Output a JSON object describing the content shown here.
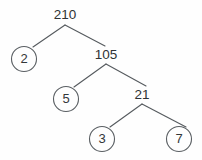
{
  "figure": {
    "type": "factor-tree",
    "background_color": "#fefefe",
    "line_color": "#555a5e",
    "text_color": "#333739"
  },
  "nodes": [
    {
      "id": "n210",
      "label": "210",
      "style": "plain",
      "x": 65,
      "y": 15,
      "radius": 0
    },
    {
      "id": "n2",
      "label": "2",
      "style": "circled",
      "x": 24,
      "y": 59,
      "radius": 12.5
    },
    {
      "id": "n105",
      "label": "105",
      "style": "plain",
      "x": 106,
      "y": 55,
      "radius": 0
    },
    {
      "id": "n5",
      "label": "5",
      "style": "circled",
      "x": 66,
      "y": 99,
      "radius": 12.5
    },
    {
      "id": "n21",
      "label": "21",
      "style": "plain",
      "x": 142,
      "y": 95,
      "radius": 0
    },
    {
      "id": "n3",
      "label": "3",
      "style": "circled",
      "x": 102,
      "y": 139,
      "radius": 12.5
    },
    {
      "id": "n7",
      "label": "7",
      "style": "circled",
      "x": 179,
      "y": 139,
      "radius": 12.5
    }
  ],
  "edges": [
    {
      "id": "e210-2",
      "from": "n210",
      "to": "n2",
      "path": "M 65 25 L 33 47"
    },
    {
      "id": "e210-105",
      "from": "n210",
      "to": "n105",
      "path": "M 65 25 L 105 46"
    },
    {
      "id": "e105-5",
      "from": "n105",
      "to": "n5",
      "path": "M 106 64 L 74 87"
    },
    {
      "id": "e105-21",
      "from": "n105",
      "to": "n21",
      "path": "M 106 64 L 146 86"
    },
    {
      "id": "e21-3",
      "from": "n21",
      "to": "n3",
      "path": "M 142 104 L 110 127"
    },
    {
      "id": "e21-7",
      "from": "n21",
      "to": "n7",
      "path": "M 142 104 L 186 127"
    }
  ]
}
